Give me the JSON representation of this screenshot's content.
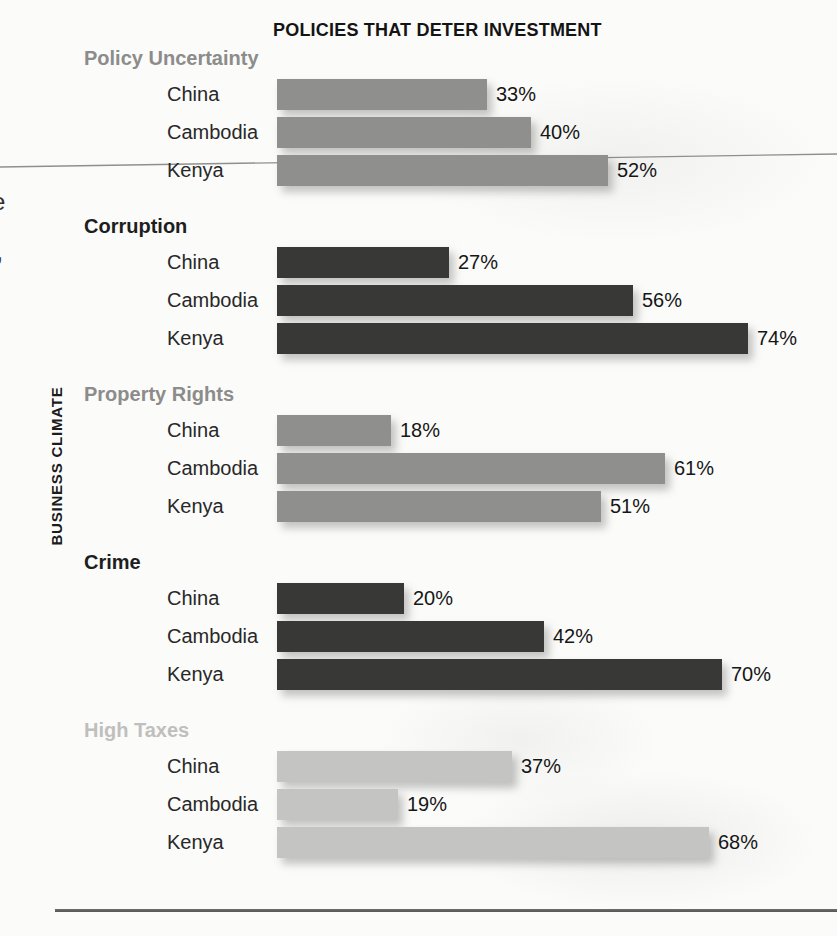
{
  "page": {
    "title": "POLICIES THAT DETER INVESTMENT",
    "y_axis_label": "BUSINESS CLIMATE",
    "artifacts": {
      "left_edge_char_1": "e",
      "left_edge_char_2": ","
    }
  },
  "chart_data": {
    "type": "bar",
    "orientation": "horizontal",
    "title": "POLICIES THAT DETER INVESTMENT",
    "ylabel": "BUSINESS CLIMATE",
    "xlabel": "",
    "value_unit": "%",
    "xlim": [
      0,
      100
    ],
    "grid": false,
    "legend": false,
    "data_labels": true,
    "categories": [
      "China",
      "Cambodia",
      "Kenya"
    ],
    "groups": [
      {
        "label": "Policy Uncertainty",
        "bar_color": "#8f8f8d",
        "label_color": "#8c8c8a",
        "values": [
          33,
          40,
          52
        ]
      },
      {
        "label": "Corruption",
        "bar_color": "#383836",
        "label_color": "#1e1e1e",
        "values": [
          27,
          56,
          74
        ]
      },
      {
        "label": "Property Rights",
        "bar_color": "#8f8f8d",
        "label_color": "#8c8c8a",
        "values": [
          18,
          61,
          51
        ]
      },
      {
        "label": "Crime",
        "bar_color": "#383836",
        "label_color": "#1e1e1e",
        "values": [
          20,
          42,
          70
        ]
      },
      {
        "label": "High Taxes",
        "bar_color": "#c4c4c2",
        "label_color": "#bfbfbd",
        "values": [
          37,
          19,
          68
        ]
      }
    ]
  }
}
